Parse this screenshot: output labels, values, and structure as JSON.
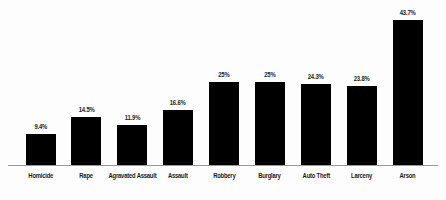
{
  "chart_data": {
    "type": "bar",
    "title": "",
    "subtitle": "",
    "xlabel": "",
    "ylabel": "",
    "categories": [
      "Homicide",
      "Rape",
      "Agravated Assault",
      "Assault",
      "Robbery",
      "Burglary",
      "Auto Theft",
      "Larceny",
      "Arson"
    ],
    "values": [
      9.4,
      14.5,
      11.9,
      16.6,
      25,
      25,
      24.3,
      23.8,
      43.7
    ],
    "value_labels": [
      "9.4%",
      "14.5%",
      "11.9%",
      "16.6%",
      "25%",
      "25%",
      "24.3%",
      "23.8%",
      "43.7%"
    ],
    "ylim": [
      0,
      47
    ],
    "grid": false,
    "legend": false,
    "legend_position": "none",
    "bar_color": "#000000",
    "baseline_color": "#9a9a9a",
    "background_color": "#fdfdfd",
    "text_color": "#1b1b1b"
  }
}
